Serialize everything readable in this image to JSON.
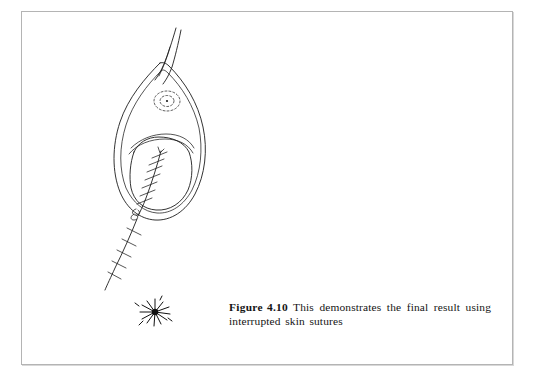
{
  "page": {
    "background_color": "#ffffff",
    "frame_color": "#b4b4b4"
  },
  "caption": {
    "figure_label": "Figure 4.10",
    "text": "This demonstrates the final result using interrupted skin sutures",
    "line1": "This demonstrates the final",
    "line2": "result using interrupted skin sutures"
  },
  "illustration": {
    "name": "surgical-line-drawing",
    "description": "Line drawing of a closed surgical wound showing interrupted skin sutures",
    "ink_color": "#1c1c1c",
    "elements": [
      {
        "name": "spermatic-cord",
        "kind": "line-pair"
      },
      {
        "name": "outer-contour",
        "kind": "teardrop-outline"
      },
      {
        "name": "inner-sac",
        "kind": "rounded-outline"
      },
      {
        "name": "dashed-marker-circle",
        "kind": "dashed-circle-with-dot"
      },
      {
        "name": "interrupted-suture-line",
        "kind": "stitched-seam"
      },
      {
        "name": "suture-tail",
        "kind": "stitched-seam-diagonal"
      },
      {
        "name": "starburst-mark",
        "kind": "radiating-burst"
      }
    ]
  }
}
